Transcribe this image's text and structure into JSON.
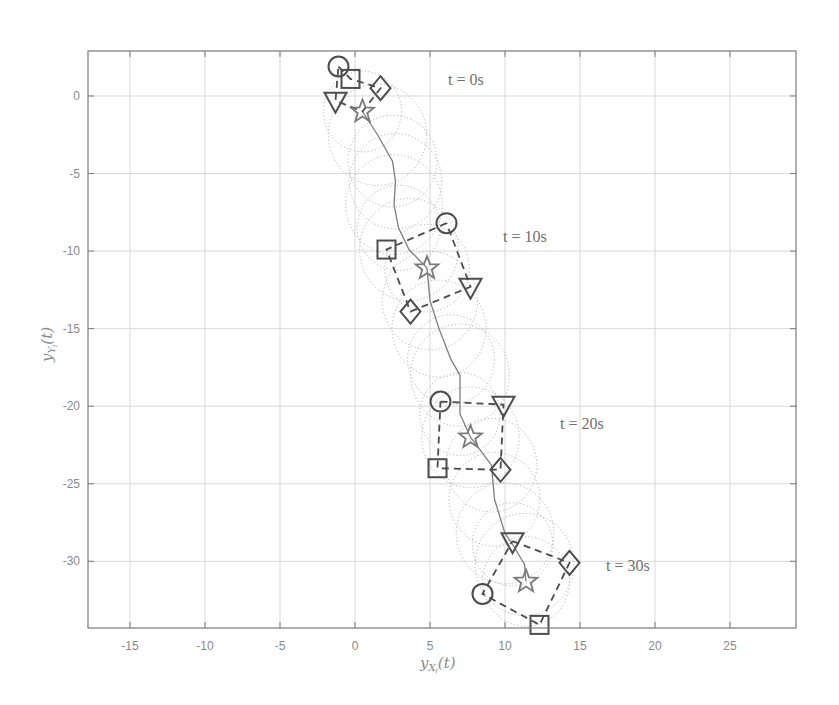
{
  "chart_data": {
    "type": "scatter",
    "title": "",
    "xlabel": "y_{X_i}(t)",
    "ylabel": "y_{Y_i}(t)",
    "xlim": [
      -17.8,
      29.4
    ],
    "ylim": [
      -34.3,
      2.9
    ],
    "grid": true,
    "legend": null,
    "x_ticks": [
      -15,
      -10,
      -5,
      0,
      5,
      10,
      15,
      20,
      25
    ],
    "y_ticks": [
      0,
      -5,
      -10,
      -15,
      -20,
      -25,
      -30
    ],
    "x_tick_labels": [
      "-15",
      "-10",
      "-5",
      "0",
      "5",
      "10",
      "15",
      "20",
      "25"
    ],
    "y_tick_labels": [
      "0",
      "-5",
      "-10",
      "-15",
      "-20",
      "-25",
      "-30"
    ],
    "leader_path": {
      "name": "star trajectory",
      "style": "solid",
      "points": [
        [
          0.5,
          -1.0
        ],
        [
          1.5,
          -2.5
        ],
        [
          2.5,
          -4.2
        ],
        [
          2.7,
          -5.5
        ],
        [
          2.6,
          -7.0
        ],
        [
          2.9,
          -8.5
        ],
        [
          3.6,
          -9.9
        ],
        [
          4.8,
          -11.1
        ],
        [
          5.0,
          -13.2
        ],
        [
          5.6,
          -15.0
        ],
        [
          6.4,
          -17.0
        ],
        [
          7.0,
          -18.0
        ],
        [
          7.0,
          -20.5
        ],
        [
          7.7,
          -22.0
        ],
        [
          9.1,
          -23.8
        ],
        [
          9.3,
          -26.0
        ],
        [
          10.0,
          -28.2
        ],
        [
          10.5,
          -28.9
        ],
        [
          11.3,
          -30.2
        ],
        [
          11.4,
          -31.3
        ]
      ]
    },
    "formations": [
      {
        "label": "t = 0s",
        "label_pos": [
          6.2,
          1.0
        ],
        "agents": {
          "circle": [
            -1.1,
            1.9
          ],
          "square": [
            -0.3,
            1.1
          ],
          "diamond": [
            1.7,
            0.5
          ],
          "triangle": [
            -1.3,
            -0.3
          ],
          "star": [
            0.5,
            -1.0
          ]
        },
        "ring_order": [
          "circle",
          "square",
          "diamond",
          "star",
          "triangle"
        ]
      },
      {
        "label": "t = 10s",
        "label_pos": [
          9.9,
          -9.2
        ],
        "agents": {
          "circle": [
            6.1,
            -8.2
          ],
          "square": [
            2.1,
            -9.9
          ],
          "diamond": [
            3.7,
            -13.9
          ],
          "triangle": [
            7.7,
            -12.3
          ],
          "star": [
            4.8,
            -11.1
          ]
        },
        "ring_order": [
          "circle",
          "square",
          "diamond",
          "triangle"
        ]
      },
      {
        "label": "t = 20s",
        "label_pos": [
          13.7,
          -21.4
        ],
        "agents": {
          "circle": [
            5.7,
            -19.7
          ],
          "square": [
            5.5,
            -24.0
          ],
          "diamond": [
            9.7,
            -24.1
          ],
          "triangle": [
            9.9,
            -19.9
          ],
          "star": [
            7.7,
            -22.0
          ]
        },
        "ring_order": [
          "circle",
          "triangle",
          "diamond",
          "square"
        ]
      },
      {
        "label": "t = 30s",
        "label_pos": [
          16.8,
          -30.6
        ],
        "agents": {
          "circle": [
            8.5,
            -32.1
          ],
          "square": [
            12.3,
            -34.1
          ],
          "diamond": [
            14.3,
            -30.1
          ],
          "triangle": [
            10.5,
            -28.7
          ],
          "star": [
            11.4,
            -31.3
          ]
        },
        "ring_order": [
          "triangle",
          "diamond",
          "square",
          "circle"
        ]
      }
    ],
    "annotations": [
      "t = 0s",
      "t = 10s",
      "t = 20s",
      "t = 30s"
    ],
    "dotted_circles_note": "dotted sensing circles (r≈2.5–3.3 units) drawn along leader path"
  },
  "labels": {
    "x_axis": "y",
    "x_axis_sub": "X",
    "x_axis_subsub": "i",
    "x_axis_tail": "(t)",
    "y_axis": "y",
    "y_axis_sub": "Y",
    "y_axis_subsub": "i",
    "y_axis_tail": "(t)",
    "t0": "t = 0s",
    "t10": "t = 10s",
    "t20": "t = 20s",
    "t30": "t = 30s"
  },
  "colors": {
    "grid": "#d9d9d9",
    "frame": "#7a7a7a",
    "marker": "#4d4d4d",
    "path": "#7d7d7d",
    "text": "#8a8a8a"
  }
}
